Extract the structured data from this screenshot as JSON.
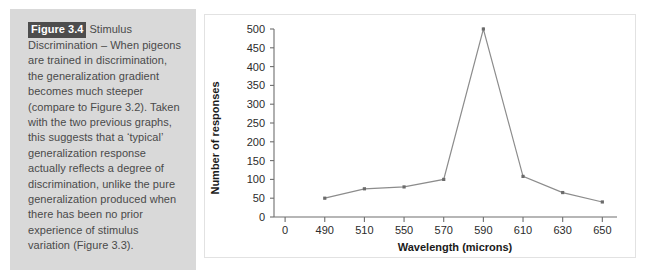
{
  "figure": {
    "badge": "Figure 3.4",
    "caption_body": "Stimulus Discrimination – When pigeons are trained in discrimination, the generalization gradient becomes much steeper (compare to Figure 3.2). Taken with the two previous graphs, this suggests that a ‘typical’ generalization response actually reflects a degree of discrimination, unlike the pure generalization produced when there has been no prior experience of stimulus variation (Figure 3.3)."
  },
  "colors": {
    "caption_panel_bg": "#d9d9d9",
    "badge_bg": "#4d4d4d",
    "badge_text": "#ffffff",
    "caption_text": "#4a4a4a",
    "chart_panel_bg": "#ffffff",
    "chart_panel_border": "#e2e2e2",
    "axis": "#6e6e6e",
    "series_line": "#8c8c8c",
    "series_marker": "#6b6b6b"
  },
  "chart_data": {
    "type": "line",
    "title": "",
    "xlabel": "Wavelength (microns)",
    "ylabel": "Number of responses",
    "categories": [
      "0",
      "490",
      "510",
      "550",
      "570",
      "590",
      "610",
      "630",
      "650"
    ],
    "x_tick_labels": [
      "0",
      "490",
      "510",
      "550",
      "570",
      "590",
      "610",
      "630",
      "650"
    ],
    "y_tick_labels": [
      "0",
      "50",
      "100",
      "150",
      "200",
      "250",
      "300",
      "350",
      "400",
      "450",
      "500"
    ],
    "y_ticks": [
      0,
      50,
      100,
      150,
      200,
      250,
      300,
      350,
      400,
      450,
      500
    ],
    "ylim": [
      0,
      500
    ],
    "grid": false,
    "legend": "none",
    "series": [
      {
        "name": "Number of responses",
        "x": [
          "490",
          "510",
          "550",
          "570",
          "590",
          "610",
          "630",
          "650"
        ],
        "values": [
          50,
          75,
          80,
          100,
          500,
          108,
          65,
          40
        ]
      }
    ]
  }
}
